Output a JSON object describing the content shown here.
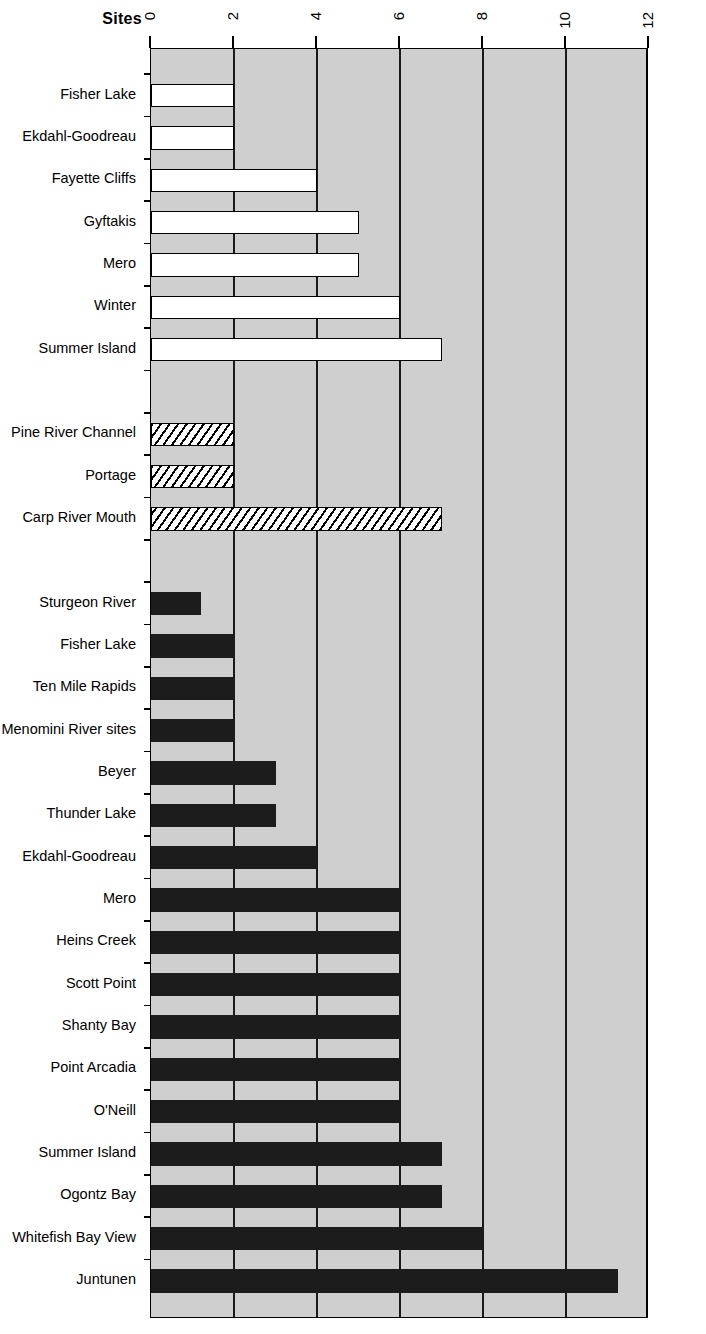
{
  "chart_data": {
    "type": "bar",
    "orientation": "horizontal",
    "title": "",
    "xlabel": "",
    "ylabel": "Sites",
    "xlim": [
      0,
      12
    ],
    "xticks": [
      0,
      2,
      4,
      6,
      8,
      10,
      12
    ],
    "xtick_labels": [
      "0",
      "2",
      "4",
      "6",
      "8",
      "10",
      "12"
    ],
    "grid": true,
    "legend": null,
    "plot_background": "#cfcfcf",
    "groups": [
      {
        "name": "open",
        "fill": "white",
        "categories": [
          "Fisher Lake",
          "Ekdahl-Goodreau",
          "Fayette Cliffs",
          "Gyftakis",
          "Mero",
          "Winter",
          "Summer Island"
        ],
        "values": [
          2,
          2,
          4,
          5,
          5,
          6,
          7
        ]
      },
      {
        "name": "hatched",
        "fill": "diagonal-hatch",
        "categories": [
          "Pine River Channel",
          "Portage",
          "Carp River Mouth"
        ],
        "values": [
          2,
          2,
          7
        ]
      },
      {
        "name": "solid",
        "fill": "black",
        "categories": [
          "Sturgeon River",
          "Fisher Lake",
          "Ten Mile Rapids",
          "Menomini River sites",
          "Beyer",
          "Thunder Lake",
          "Ekdahl-Goodreau",
          "Mero",
          "Heins Creek",
          "Scott Point",
          "Shanty Bay",
          "Point Arcadia",
          "O'Neill",
          "Summer Island",
          "Ogontz Bay",
          "Whitefish Bay View",
          "Juntunen"
        ],
        "values": [
          1.2,
          2,
          2,
          2,
          3,
          3,
          4,
          6,
          6,
          6,
          6,
          6,
          6,
          7,
          7,
          8,
          11.25
        ]
      }
    ]
  },
  "axis": {
    "sites_label": "Sites"
  },
  "colors": {
    "plot_fill": "#cfcfcf",
    "bar_solid": "#1c1c1c",
    "bar_open": "#ffffff",
    "line": "#000000"
  }
}
